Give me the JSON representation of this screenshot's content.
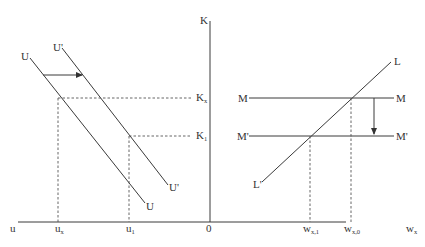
{
  "diagram": {
    "left_panel": {
      "vertical_axis_label": "K",
      "horizontal_axis_left_label": "u",
      "origin_label": "0",
      "curves": [
        {
          "name": "U",
          "label_top": "U",
          "label_bottom": "U"
        },
        {
          "name": "U'",
          "label_top": "U'",
          "label_bottom": "U'"
        }
      ],
      "levels": {
        "k_x": {
          "main": "K",
          "sub": "x"
        },
        "k_1": {
          "main": "K",
          "sub": "1"
        }
      },
      "ticks": {
        "u_x": {
          "main": "u",
          "sub": "x"
        },
        "u_1": {
          "main": "u",
          "sub": "1"
        }
      },
      "shift_arrow": "rightward shift from U to U'"
    },
    "right_panel": {
      "horizontal_axis_label": {
        "main": "w",
        "sub": "x"
      },
      "curves": [
        {
          "name": "L",
          "label_top": "L",
          "label_bottom": "L'"
        },
        {
          "name": "M",
          "label_left": "M",
          "label_right": "M"
        },
        {
          "name": "M'",
          "label_left": "M'",
          "label_right": "M'"
        }
      ],
      "ticks": {
        "w_x1": {
          "main": "w",
          "sub": "x,1"
        },
        "w_x0": {
          "main": "w",
          "sub": "x,0"
        }
      },
      "shift_arrow": "downward shift from M to M'"
    }
  }
}
